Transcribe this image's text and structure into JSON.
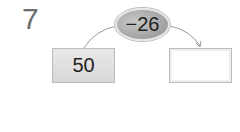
{
  "problem": {
    "number": "7"
  },
  "operation": {
    "label": "−26"
  },
  "start_box": {
    "value": "50"
  },
  "result_box": {
    "value": ""
  }
}
